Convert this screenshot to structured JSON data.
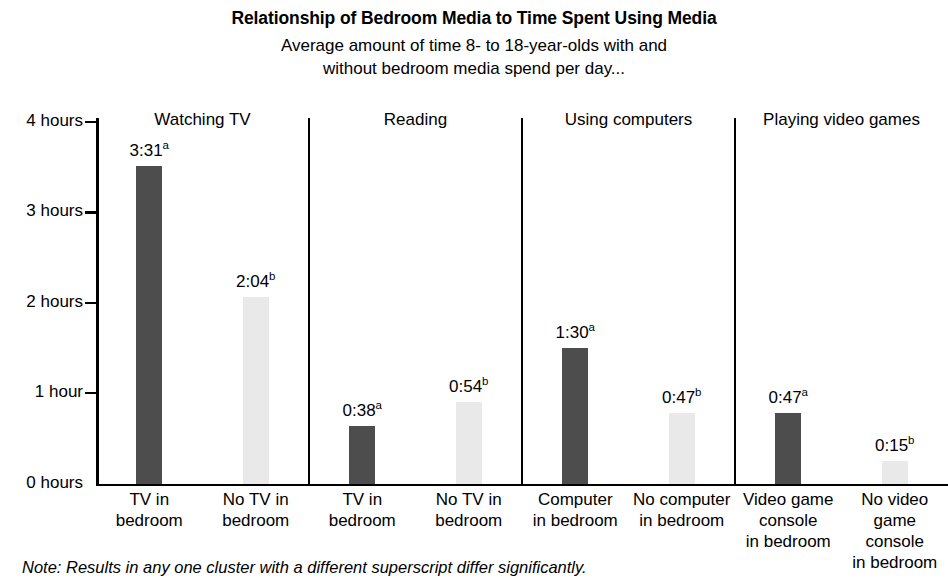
{
  "chart_data": {
    "type": "bar",
    "title": "Relationship of Bedroom Media to Time Spent Using Media",
    "subtitle_line1": "Average amount of time 8- to 18-year-olds with and",
    "subtitle_line2": "without bedroom media spend per day...",
    "xlabel": "",
    "ylabel": "",
    "ylim": [
      0,
      4
    ],
    "grid": false,
    "legend_position": "none",
    "y_tick_labels": [
      "4 hours",
      "3 hours",
      "2 hours",
      "1 hour",
      "0 hours"
    ],
    "y_tick_values": [
      4,
      3,
      2,
      1,
      0
    ],
    "colors": {
      "with_media_bar": "#4d4d4d",
      "without_media_bar": "#e9e9e9",
      "axis": "#000000",
      "background": "#ffffff"
    },
    "clusters": [
      {
        "header": "Watching TV",
        "bars": [
          {
            "category_line1": "TV in",
            "category_line2": "bedroom",
            "category_line3": "",
            "value_label": "3:31",
            "superscript": "a",
            "hours": 3.5167,
            "style": "dark"
          },
          {
            "category_line1": "No TV in",
            "category_line2": "bedroom",
            "category_line3": "",
            "value_label": "2:04",
            "superscript": "b",
            "hours": 2.0667,
            "style": "light"
          }
        ]
      },
      {
        "header": "Reading",
        "bars": [
          {
            "category_line1": "TV in",
            "category_line2": "bedroom",
            "category_line3": "",
            "value_label": "0:38",
            "superscript": "a",
            "hours": 0.6333,
            "style": "dark"
          },
          {
            "category_line1": "No TV in",
            "category_line2": "bedroom",
            "category_line3": "",
            "value_label": "0:54",
            "superscript": "b",
            "hours": 0.9,
            "style": "light"
          }
        ]
      },
      {
        "header": "Using computers",
        "bars": [
          {
            "category_line1": "Computer",
            "category_line2": "in bedroom",
            "category_line3": "",
            "value_label": "1:30",
            "superscript": "a",
            "hours": 1.5,
            "style": "dark"
          },
          {
            "category_line1": "No computer",
            "category_line2": "in bedroom",
            "category_line3": "",
            "value_label": "0:47",
            "superscript": "b",
            "hours": 0.7833,
            "style": "light"
          }
        ]
      },
      {
        "header": "Playing video games",
        "bars": [
          {
            "category_line1": "Video game",
            "category_line2": "console",
            "category_line3": "in bedroom",
            "value_label": "0:47",
            "superscript": "a",
            "hours": 0.7833,
            "style": "dark"
          },
          {
            "category_line1": "No video",
            "category_line2": "game",
            "category_line3": "console",
            "category_line4": "in bedroom",
            "value_label": "0:15",
            "superscript": "b",
            "hours": 0.25,
            "style": "light"
          }
        ]
      }
    ],
    "note": "Note: Results in any one cluster with a different superscript differ significantly."
  }
}
